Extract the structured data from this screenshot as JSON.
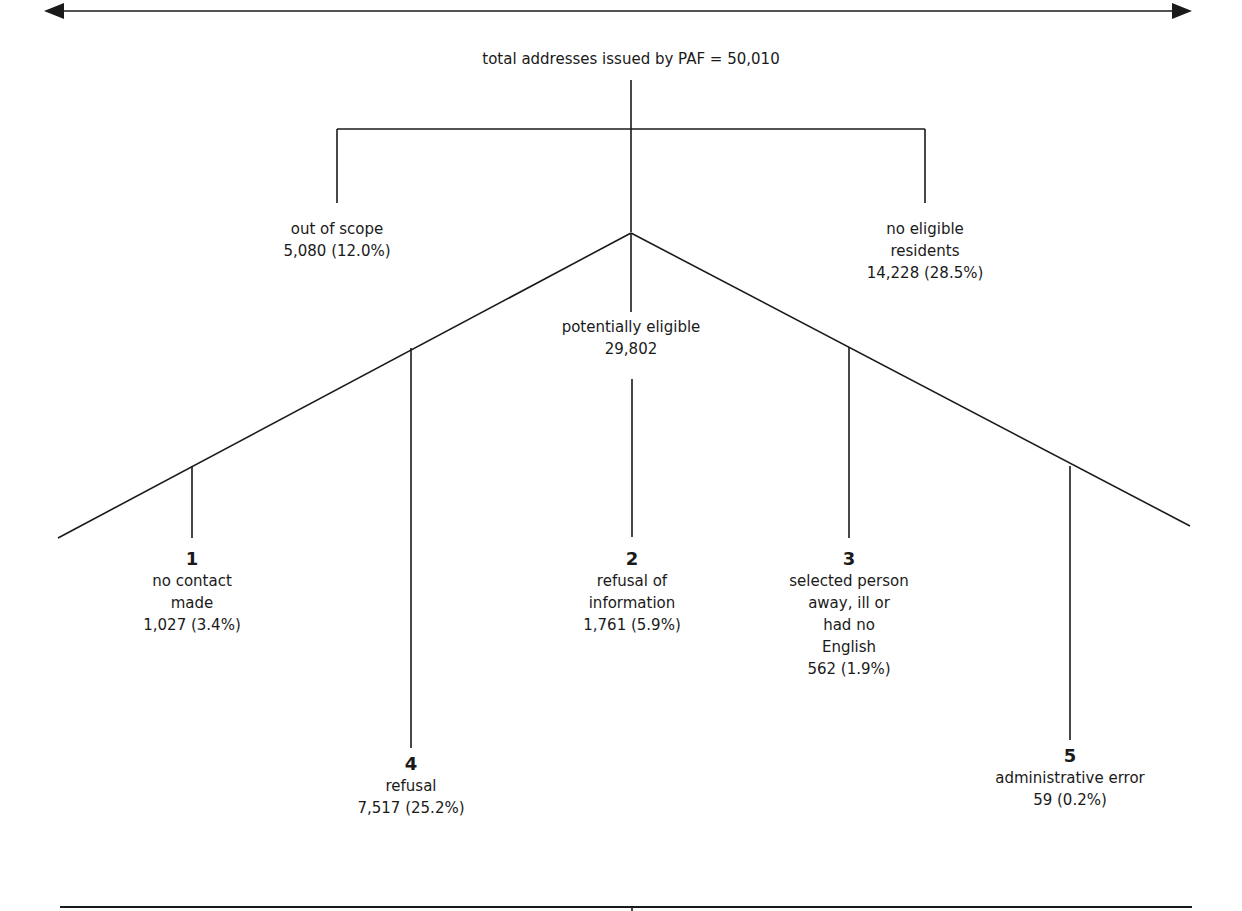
{
  "diagram": {
    "colors": {
      "line": "#1a1a1a",
      "text": "#1a1a1a",
      "background": "#ffffff"
    },
    "root": {
      "label": "total addresses issued by PAF = 50,010"
    },
    "first_level": [
      {
        "id": "out_of_scope",
        "lines": [
          "out of scope",
          "5,080 (12.0%)"
        ]
      },
      {
        "id": "potentially_eligible",
        "lines": [
          "potentially eligible",
          "29,802"
        ]
      },
      {
        "id": "no_eligible_residents",
        "lines": [
          "no eligible",
          "residents",
          "14,228 (28.5%)"
        ]
      }
    ],
    "outcomes": [
      {
        "number": "1",
        "lines": [
          "no contact",
          "made",
          "1,027 (3.4%)"
        ]
      },
      {
        "number": "2",
        "lines": [
          "refusal of",
          "information",
          "1,761 (5.9%)"
        ]
      },
      {
        "number": "3",
        "lines": [
          "selected person",
          "away, ill or",
          "had no",
          "English",
          "562 (1.9%)"
        ]
      },
      {
        "number": "4",
        "lines": [
          "refusal",
          "7,517 (25.2%)"
        ]
      },
      {
        "number": "5",
        "lines": [
          "administrative error",
          "59 (0.2%)"
        ]
      }
    ]
  }
}
